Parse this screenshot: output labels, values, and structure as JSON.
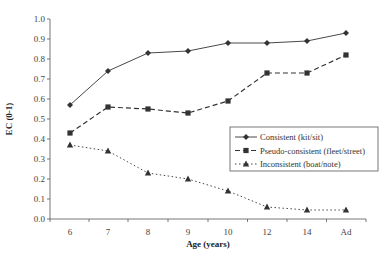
{
  "chart_data": {
    "type": "line",
    "title": "",
    "xlabel": "Age (years)",
    "ylabel": "EC (0-1)",
    "ylim": [
      0.0,
      1.0
    ],
    "yticks": [
      "0.0",
      "0.1",
      "0.2",
      "0.3",
      "0.4",
      "0.5",
      "0.6",
      "0.7",
      "0.8",
      "0.9",
      "1.0"
    ],
    "grid": false,
    "legend_position": "right-middle inside",
    "categories": [
      "6",
      "7",
      "8",
      "9",
      "10",
      "12",
      "14",
      "Ad"
    ],
    "series": [
      {
        "name": "Consistent (kit/sit)",
        "marker": "diamond",
        "line": "solid",
        "values": [
          0.57,
          0.74,
          0.83,
          0.84,
          0.88,
          0.88,
          0.89,
          0.93
        ]
      },
      {
        "name": "Pseudo-consistent (fleet/street)",
        "marker": "square",
        "line": "dashed",
        "values": [
          0.43,
          0.56,
          0.55,
          0.53,
          0.59,
          0.73,
          0.73,
          0.82
        ]
      },
      {
        "name": "Inconsistent (boat/note)",
        "marker": "triangle",
        "line": "dotted",
        "values": [
          0.37,
          0.34,
          0.23,
          0.2,
          0.14,
          0.06,
          0.045,
          0.045
        ]
      }
    ]
  },
  "colors": {
    "line": "#333333",
    "axis": "#555555"
  }
}
